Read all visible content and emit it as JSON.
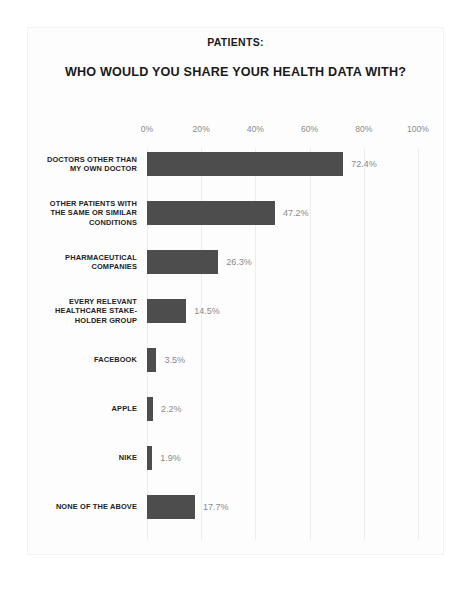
{
  "chart_data": {
    "type": "bar",
    "orientation": "horizontal",
    "title": "WHO WOULD YOU SHARE YOUR HEALTH DATA WITH?",
    "supertitle": "PATIENTS:",
    "xlabel": "",
    "ylabel": "",
    "xlim": [
      0,
      100
    ],
    "grid": true,
    "legend": "none",
    "bar_color": "#4d4d4d",
    "tick_labels": [
      "0%",
      "20%",
      "40%",
      "60%",
      "80%",
      "100%"
    ],
    "tick_values": [
      0,
      20,
      40,
      60,
      80,
      100
    ],
    "categories": [
      "DOCTORS OTHER THAN MY OWN DOCTOR",
      "OTHER PATIENTS WITH THE SAME OR SIMILAR CONDITIONS",
      "PHARMACEUTICAL COMPANIES",
      "EVERY RELEVANT HEALTHCARE STAKE-HOLDER GROUP",
      "FACEBOOK",
      "APPLE",
      "NIKE",
      "NONE OF THE ABOVE"
    ],
    "category_lines": [
      [
        "DOCTORS OTHER THAN",
        "MY OWN DOCTOR"
      ],
      [
        "OTHER PATIENTS WITH",
        "THE SAME OR SIMILAR",
        "CONDITIONS"
      ],
      [
        "PHARMACEUTICAL",
        "COMPANIES"
      ],
      [
        "EVERY RELEVANT",
        "HEALTHCARE STAKE-",
        "HOLDER GROUP"
      ],
      [
        "FACEBOOK"
      ],
      [
        "APPLE"
      ],
      [
        "NIKE"
      ],
      [
        "NONE OF THE ABOVE"
      ]
    ],
    "values": [
      72.4,
      47.2,
      26.3,
      14.5,
      3.5,
      2.2,
      1.9,
      17.7
    ],
    "value_labels": [
      "72.4%",
      "47.2%",
      "26.3%",
      "14.5%",
      "3.5%",
      "2.2%",
      "1.9%",
      "17.7%"
    ]
  },
  "caption": {
    "text": ""
  }
}
